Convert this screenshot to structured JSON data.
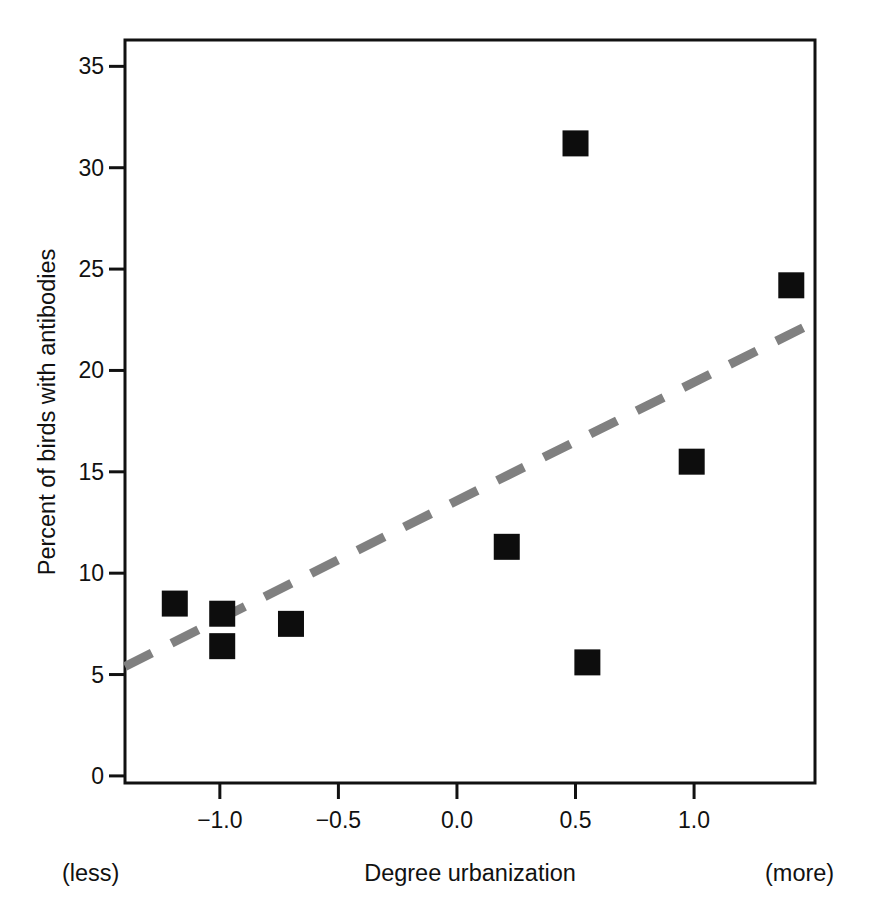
{
  "chart_data": {
    "type": "scatter",
    "title": "",
    "xlabel": "Degree urbanization",
    "ylabel": "Percent of birds with antibodies",
    "xlim": [
      -1.4,
      1.51
    ],
    "ylim": [
      -0.35,
      36.3
    ],
    "grid": false,
    "legend": null,
    "x_ticks": [
      -1.0,
      -0.5,
      0.0,
      0.5,
      1.0
    ],
    "x_tick_labels": [
      "−1.0",
      "−0.5",
      "0.0",
      "0.5",
      "1.0"
    ],
    "y_ticks": [
      0,
      5,
      10,
      15,
      20,
      25,
      30,
      35
    ],
    "y_tick_labels": [
      "0",
      "5",
      "10",
      "15",
      "20",
      "25",
      "30",
      "35"
    ],
    "annotations": {
      "left_note": "(less)",
      "right_note": "(more)"
    },
    "marker": {
      "shape": "square",
      "color": "#0d0d0d",
      "size_px": 26
    },
    "points": [
      {
        "x": -1.19,
        "y": 8.5
      },
      {
        "x": -0.99,
        "y": 8.0
      },
      {
        "x": -0.99,
        "y": 6.4
      },
      {
        "x": -0.7,
        "y": 7.5
      },
      {
        "x": 0.21,
        "y": 11.3
      },
      {
        "x": 0.5,
        "y": 31.2
      },
      {
        "x": 0.55,
        "y": 5.6
      },
      {
        "x": 0.99,
        "y": 15.5
      },
      {
        "x": 1.41,
        "y": 24.2
      }
    ],
    "trend_line": {
      "style": "dashed",
      "color": "#808080",
      "width_px": 9,
      "dash_px": [
        30,
        22
      ],
      "x_start": -1.4,
      "y_start": 5.4,
      "x_end": 1.51,
      "y_end": 22.4
    }
  },
  "axes": {
    "frame_color": "#111111",
    "frame_width_px": 3
  }
}
